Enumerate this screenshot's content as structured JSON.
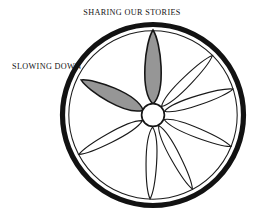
{
  "canvas": {
    "width": 264,
    "height": 224,
    "background": "#ffffff"
  },
  "diagram": {
    "kind": "wheel-diagram",
    "title_visible": false,
    "wheel": {
      "center_x": 153,
      "center_y": 115,
      "tire_outer_radius": 93,
      "tire_inner_radius": 88,
      "rim_line_radius": 84,
      "hub_outer_radius": 12,
      "hub_fill": "#ffffff",
      "tire_color": "#121212",
      "line_color": "#1a1a1a",
      "spoke_fill_empty": "#ffffff",
      "spoke_fill_highlight": "#969696",
      "spoke_count": 8
    },
    "spokes": [
      {
        "id": "spoke-1",
        "angle_deg": -90,
        "highlighted": true,
        "label_ref": "sharing-our-stories",
        "width": 11
      },
      {
        "id": "spoke-2",
        "angle_deg": -45,
        "highlighted": false,
        "label_ref": null,
        "width": 8
      },
      {
        "id": "spoke-3",
        "angle_deg": -18,
        "highlighted": false,
        "label_ref": null,
        "width": 8
      },
      {
        "id": "spoke-4",
        "angle_deg": 22,
        "highlighted": false,
        "label_ref": null,
        "width": 8
      },
      {
        "id": "spoke-5",
        "angle_deg": 62,
        "highlighted": false,
        "label_ref": null,
        "width": 8
      },
      {
        "id": "spoke-6",
        "angle_deg": 92,
        "highlighted": false,
        "label_ref": null,
        "width": 9
      },
      {
        "id": "spoke-7",
        "angle_deg": 152,
        "highlighted": false,
        "label_ref": null,
        "width": 8
      },
      {
        "id": "spoke-8",
        "angle_deg": -154,
        "highlighted": true,
        "label_ref": "slowing-down",
        "width": 10
      }
    ]
  },
  "labels": {
    "sharing_our_stories": "SHARING OUR STORIES",
    "slowing_down": "SLOWING DOWN"
  },
  "colors": {
    "ink": "#141414",
    "tire": "#121212",
    "highlight_gray": "#969696",
    "paper": "#ffffff"
  }
}
